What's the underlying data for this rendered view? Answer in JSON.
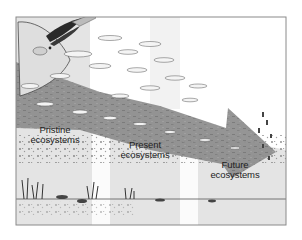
{
  "figure": {
    "title": "",
    "stages": [
      {
        "id": "pristine",
        "line1": "Pristine",
        "line2": "ecosystems"
      },
      {
        "id": "present",
        "line1": "Present",
        "line2": "ecosystems"
      },
      {
        "id": "future",
        "line1": "Future",
        "line2": "ecosystems"
      }
    ],
    "arrow": {
      "direction": "downward-right",
      "meaning": "decline over time"
    },
    "colors": {
      "frame": "#8a8a8a",
      "panel_gray": "#e4e4e4",
      "band_white": "#ffffff",
      "arrow": "#8f8f8f",
      "seabed_line": "#555555",
      "ink": "#222222"
    }
  }
}
